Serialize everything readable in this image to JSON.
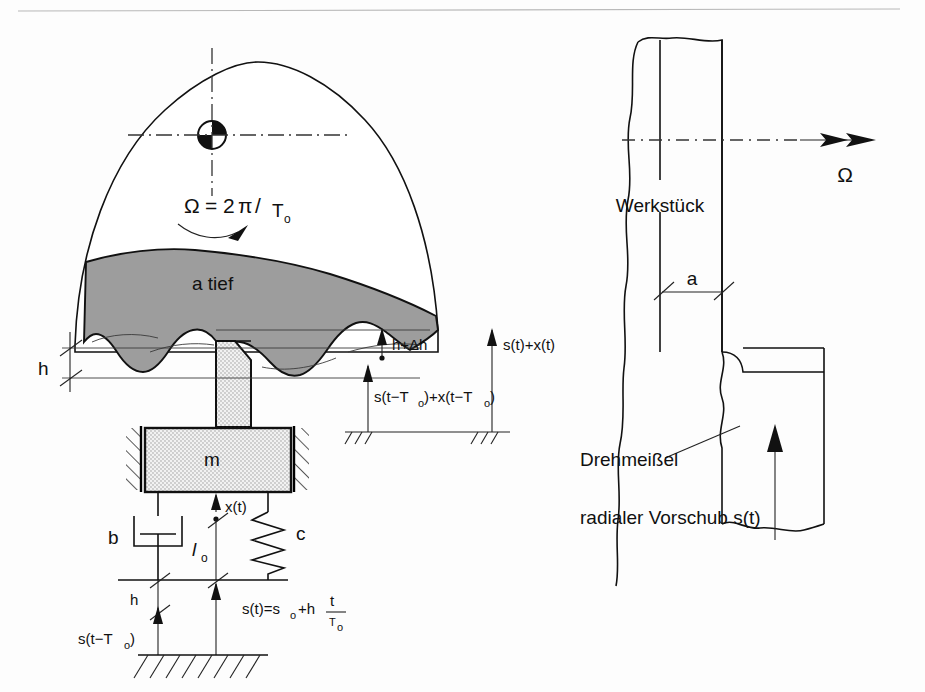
{
  "figure": {
    "background_color": "#fdfdfd",
    "chip_fill_color": "#9d9d9d",
    "line_color": "#111111"
  },
  "left_diagram": {
    "name": "schnittmodell-links",
    "omega_formula": "Ω = 2π/T",
    "omega_symbol": "Ω",
    "omega_equals": "= 2",
    "omega_pi": "π",
    "omega_slash": "/",
    "omega_T": "T",
    "omega_sub": "o",
    "depth_label": "a  tief",
    "h_label": "h",
    "h_delta_label": "h+Δh",
    "surface_prev_label": "s(t−T",
    "surface_prev_sub": "o",
    "surface_prev_tail": ")+x(t−T",
    "surface_prev_sub2": "o",
    "surface_prev_end": ")",
    "surface_prev_full": "s(t−Tₒ)+x(t−Tₒ)",
    "surface_now_label": "s(t)+x(t)",
    "mass_label": "m",
    "damper_label": "b",
    "spring_label": "c",
    "displacement_label": "x(t)",
    "length_label": "l",
    "length_sub": "o",
    "feed_prev_label": "s(t−T",
    "feed_prev_sub": "o",
    "feed_prev_end": ")",
    "feed_h_label": "h",
    "feed_formula_a": "s(t)=s",
    "feed_formula_sub": "o",
    "feed_formula_b": "+h",
    "feed_formula_num": "t",
    "feed_formula_den": "T",
    "feed_formula_den_sub": "o"
  },
  "right_diagram": {
    "name": "drehprozess-rechts",
    "workpiece_label": "Werkstück",
    "omega_label": "Ω",
    "depth_label": "a",
    "tool_label": "Drehmeißel",
    "feed_label": "radialer Vorschub s(t)"
  }
}
